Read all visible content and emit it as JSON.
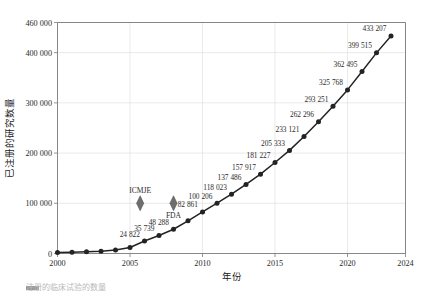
{
  "chart_data": {
    "type": "line",
    "title": "",
    "xlabel": "年份",
    "ylabel": "已注册的研究数量",
    "xlim": [
      2000,
      2024
    ],
    "ylim": [
      0,
      460000
    ],
    "grid": true,
    "legend": "none",
    "x_ticks": [
      "2000",
      "2005",
      "2010",
      "2015",
      "2020",
      "2024"
    ],
    "x_tick_values": [
      2000,
      2005,
      2010,
      2015,
      2020,
      2024
    ],
    "y_ticks": [
      "0",
      "100 000",
      "200 000",
      "300 000",
      "400 000",
      "460 000"
    ],
    "y_tick_values": [
      0,
      100000,
      200000,
      300000,
      400000,
      460000
    ],
    "series": [
      {
        "name": "已注册的研究数量",
        "color": "#232323",
        "x": [
          2000,
          2001,
          2002,
          2003,
          2004,
          2005,
          2006,
          2007,
          2008,
          2009,
          2010,
          2011,
          2012,
          2013,
          2014,
          2015,
          2016,
          2017,
          2018,
          2019,
          2020,
          2021,
          2022,
          2023
        ],
        "values": [
          2119,
          2700,
          3400,
          4400,
          7000,
          12000,
          24822,
          35739,
          48288,
          65000,
          82861,
          100206,
          118023,
          137486,
          157917,
          181227,
          205333,
          233121,
          262296,
          293251,
          325768,
          362495,
          399515,
          433207
        ]
      }
    ],
    "point_labels": [
      {
        "x": 2006,
        "value": 24822,
        "text": "24 822"
      },
      {
        "x": 2007,
        "value": 35739,
        "text": "35 739"
      },
      {
        "x": 2008,
        "value": 48288,
        "text": "48 288"
      },
      {
        "x": 2010,
        "value": 82861,
        "text": "82 861"
      },
      {
        "x": 2011,
        "value": 100206,
        "text": "100 206"
      },
      {
        "x": 2012,
        "value": 118023,
        "text": "118 023"
      },
      {
        "x": 2013,
        "value": 137486,
        "text": "137 486"
      },
      {
        "x": 2014,
        "value": 157917,
        "text": "157 917"
      },
      {
        "x": 2015,
        "value": 181227,
        "text": "181 227"
      },
      {
        "x": 2016,
        "value": 205333,
        "text": "205 333"
      },
      {
        "x": 2017,
        "value": 233121,
        "text": "233 121"
      },
      {
        "x": 2018,
        "value": 262296,
        "text": "262 296"
      },
      {
        "x": 2019,
        "value": 293251,
        "text": "293 251"
      },
      {
        "x": 2020,
        "value": 325768,
        "text": "325 768"
      },
      {
        "x": 2021,
        "value": 362495,
        "text": "362 495"
      },
      {
        "x": 2022,
        "value": 399515,
        "text": "399 515"
      },
      {
        "x": 2023,
        "value": 433207,
        "text": "433 207"
      }
    ],
    "annotations": [
      {
        "label": "ICMJE",
        "x": 2005.7,
        "y": 100000,
        "marker": "diamond",
        "color": "#6e6e6e"
      },
      {
        "label": "FDA",
        "x": 2008.0,
        "y": 100000,
        "marker": "diamond",
        "color": "#6e6e6e"
      }
    ]
  },
  "caption": {
    "text": "注册的临床试验的数量"
  }
}
